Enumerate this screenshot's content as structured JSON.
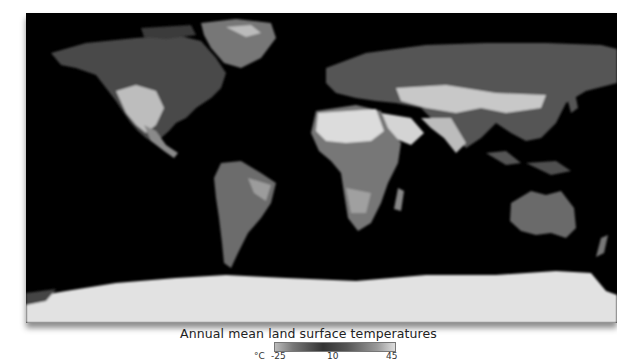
{
  "figure": {
    "title": "Annual mean land surface temperatures",
    "colorbar": {
      "unit": "°C",
      "ticks": [
        "-25",
        "10",
        "45"
      ],
      "colors": [
        "#bbbbbb",
        "#333333",
        "#dddddd"
      ]
    },
    "map": {
      "projection": "equirectangular world map",
      "background_color": "#000000",
      "regions": [
        "North America",
        "Greenland",
        "South America",
        "Europe",
        "Africa",
        "Asia",
        "Australia",
        "Antarctica"
      ]
    }
  }
}
